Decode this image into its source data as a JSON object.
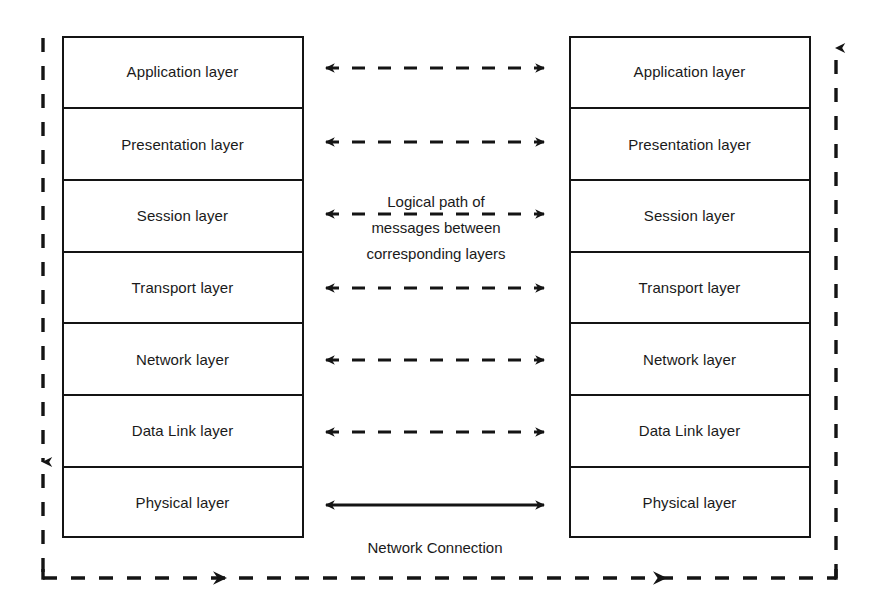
{
  "diagram": {
    "stroke_color": "#141414",
    "background_color": "#ffffff",
    "left_stack": {
      "name": "left-protocol-stack",
      "layers": [
        {
          "label": "Application layer"
        },
        {
          "label": "Presentation layer"
        },
        {
          "label": "Session layer"
        },
        {
          "label": "Transport layer"
        },
        {
          "label": "Network layer"
        },
        {
          "label": "Data Link layer"
        },
        {
          "label": "Physical layer"
        }
      ]
    },
    "right_stack": {
      "name": "right-protocol-stack",
      "layers": [
        {
          "label": "Application layer"
        },
        {
          "label": "Presentation layer"
        },
        {
          "label": "Session layer"
        },
        {
          "label": "Transport layer"
        },
        {
          "label": "Network layer"
        },
        {
          "label": "Data Link layer"
        },
        {
          "label": "Physical layer"
        }
      ]
    },
    "center_note": {
      "line1": "Logical path of",
      "line2": "messages between",
      "line3": "corresponding layers"
    },
    "network_connection_label": "Network Connection",
    "connectors": {
      "logical_arrows_count": 6,
      "logical_arrow_style": "dashed double-headed",
      "physical_arrow_style": "solid double-headed",
      "outer_path_style": "dashed with right-pointing arrowheads",
      "left_vertical_direction": "down",
      "right_vertical_direction": "up"
    }
  }
}
